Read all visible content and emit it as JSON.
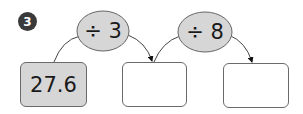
{
  "problem": {
    "number": "3",
    "start_value": "27.6",
    "operations": [
      {
        "label": "÷ 3"
      },
      {
        "label": "÷ 8"
      }
    ],
    "answer_boxes": [
      "",
      ""
    ]
  },
  "colors": {
    "filled_box": "#d6d6d6",
    "oval_fill": "#d6d6d6",
    "badge": "#3a3a3a",
    "stroke": "#555555"
  }
}
